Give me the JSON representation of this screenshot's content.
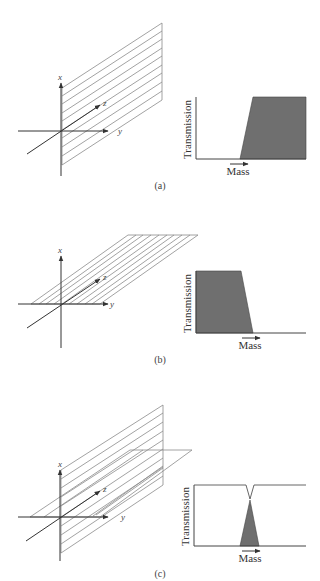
{
  "panels": [
    {
      "caption": "(a)",
      "axes_labels": {
        "x": "x",
        "y": "y",
        "z": "z"
      },
      "plane": "y-z plane (vertical slit)",
      "chart": {
        "ylabel": "Transmission",
        "xlabel": "Mass",
        "type": "high-pass"
      }
    },
    {
      "caption": "(b)",
      "axes_labels": {
        "x": "x",
        "y": "y",
        "z": "z"
      },
      "plane": "horizontal plane",
      "chart": {
        "ylabel": "Transmission",
        "xlabel": "Mass",
        "type": "low-pass"
      }
    },
    {
      "caption": "(c)",
      "axes_labels": {
        "x": "x",
        "y": "y",
        "z": "z"
      },
      "plane": "intersecting vertical and horizontal planes",
      "chart": {
        "ylabel": "Transmission",
        "xlabel": "Mass",
        "type": "band-pass"
      }
    }
  ],
  "colors": {
    "shade": "#6f6f6f",
    "lines": "#8a8a8a",
    "axes": "#333333"
  }
}
